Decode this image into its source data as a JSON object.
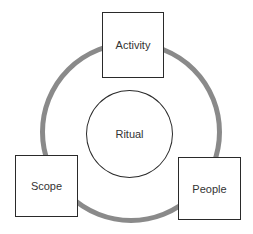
{
  "diagram": {
    "type": "cycle",
    "center": {
      "label": "Ritual"
    },
    "nodes": [
      {
        "id": "activity",
        "label": "Activity",
        "position": "top"
      },
      {
        "id": "people",
        "label": "People",
        "position": "bottom-right"
      },
      {
        "id": "scope",
        "label": "Scope",
        "position": "bottom-left"
      }
    ],
    "ring_color": "#8a8a8a",
    "border_color": "#2a2a2a"
  }
}
